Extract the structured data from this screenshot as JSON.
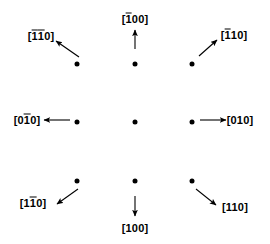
{
  "figure": {
    "type": "crystallographic-diffraction-pattern",
    "background_color": "#ffffff",
    "ink_color": "#000000"
  },
  "spots": [
    {
      "name": "spot-top-left",
      "x": 77,
      "y": 64
    },
    {
      "name": "spot-top-center",
      "x": 135,
      "y": 64
    },
    {
      "name": "spot-top-right",
      "x": 192,
      "y": 64
    },
    {
      "name": "spot-middle-left",
      "x": 77,
      "y": 122
    },
    {
      "name": "spot-center",
      "x": 135,
      "y": 122
    },
    {
      "name": "spot-middle-right",
      "x": 192,
      "y": 122
    },
    {
      "name": "spot-bottom-left",
      "x": 77,
      "y": 181
    },
    {
      "name": "spot-bottom-center",
      "x": 135,
      "y": 181
    },
    {
      "name": "spot-bottom-right",
      "x": 192,
      "y": 181
    }
  ],
  "labels": {
    "top_left": {
      "text": "[1̅1̅0]",
      "plain": "[-1-10]",
      "digits": [
        "1",
        "1",
        "0"
      ],
      "bars": [
        true,
        true,
        false
      ],
      "x": 41,
      "y": 36
    },
    "top_center": {
      "text": "[1̅00]",
      "plain": "[-100]",
      "digits": [
        "1",
        "0",
        "0"
      ],
      "bars": [
        true,
        false,
        false
      ],
      "x": 135,
      "y": 19
    },
    "top_right": {
      "text": "[1̅ 10]",
      "plain": "[-110]",
      "digits": [
        "1",
        "1",
        "0"
      ],
      "bars": [
        true,
        false,
        false
      ],
      "x": 234,
      "y": 35
    },
    "middle_left": {
      "text": "[01̅0]",
      "plain": "[0-10]",
      "digits": [
        "0",
        "1",
        "0"
      ],
      "bars": [
        false,
        true,
        false
      ],
      "x": 27,
      "y": 120
    },
    "middle_right": {
      "text": "[010]",
      "plain": "[010]",
      "digits": [
        "0",
        "1",
        "0"
      ],
      "bars": [
        false,
        false,
        false
      ],
      "x": 240,
      "y": 120
    },
    "bottom_left": {
      "text": "[11̅0]",
      "plain": "[1-10]",
      "digits": [
        "1",
        "1",
        "0"
      ],
      "bars": [
        false,
        true,
        false
      ],
      "x": 33,
      "y": 203
    },
    "bottom_center": {
      "text": "[100]",
      "plain": "[100]",
      "digits": [
        "1",
        "0",
        "0"
      ],
      "bars": [
        false,
        false,
        false
      ],
      "x": 135,
      "y": 228
    },
    "bottom_right": {
      "text": "[110]",
      "plain": "[110]",
      "digits": [
        "1",
        "1",
        "0"
      ],
      "bars": [
        false,
        false,
        false
      ],
      "x": 235,
      "y": 207
    }
  },
  "arrows": [
    {
      "name": "arrow-top-left",
      "x1": 79,
      "y1": 57,
      "x2": 56,
      "y2": 41,
      "direction": "up-left"
    },
    {
      "name": "arrow-top-center",
      "x1": 135,
      "y1": 49,
      "x2": 135,
      "y2": 30,
      "direction": "up"
    },
    {
      "name": "arrow-top-right",
      "x1": 199,
      "y1": 56,
      "x2": 217,
      "y2": 40,
      "direction": "up-right"
    },
    {
      "name": "arrow-middle-left",
      "x1": 70,
      "y1": 120,
      "x2": 44,
      "y2": 120,
      "direction": "left"
    },
    {
      "name": "arrow-middle-right",
      "x1": 200,
      "y1": 120,
      "x2": 226,
      "y2": 120,
      "direction": "right"
    },
    {
      "name": "arrow-bottom-left",
      "x1": 78,
      "y1": 189,
      "x2": 57,
      "y2": 204,
      "direction": "down-left"
    },
    {
      "name": "arrow-bottom-center",
      "x1": 135,
      "y1": 196,
      "x2": 135,
      "y2": 216,
      "direction": "down"
    },
    {
      "name": "arrow-bottom-right",
      "x1": 196,
      "y1": 189,
      "x2": 216,
      "y2": 205,
      "direction": "down-right"
    }
  ]
}
